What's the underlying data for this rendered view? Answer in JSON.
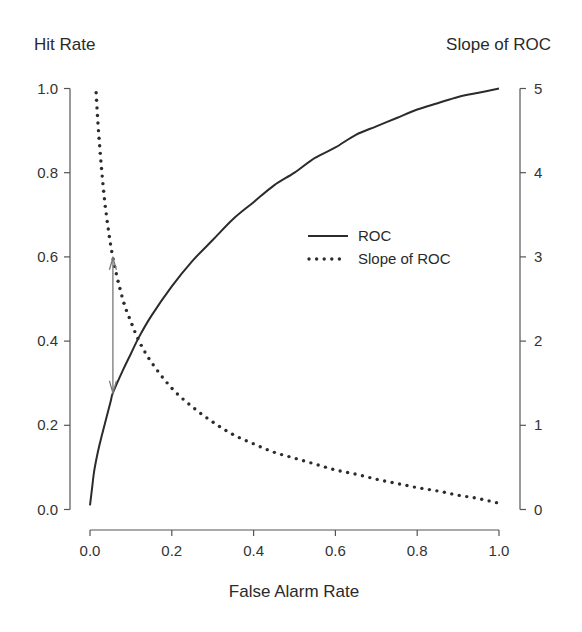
{
  "chart_data": {
    "type": "line",
    "title": "",
    "xlabel": "False Alarm Rate",
    "ylabel_left": "Hit Rate",
    "ylabel_right": "Slope  of ROC",
    "xlim": [
      0,
      1
    ],
    "ylim_left": [
      0,
      1
    ],
    "ylim_right": [
      0,
      5
    ],
    "x_ticks": [
      "0.0",
      "0.2",
      "0.4",
      "0.6",
      "0.8",
      "1.0"
    ],
    "y_left_ticks": [
      "0.0",
      "0.2",
      "0.4",
      "0.6",
      "0.8",
      "1.0"
    ],
    "y_right_ticks": [
      "0",
      "1",
      "2",
      "3",
      "4",
      "5"
    ],
    "grid": false,
    "legend": {
      "position": "center-right",
      "entries": [
        {
          "label": "ROC",
          "style": "solid"
        },
        {
          "label": "Slope of ROC",
          "style": "dotted"
        }
      ]
    },
    "series": [
      {
        "name": "ROC",
        "axis": "left",
        "style": "solid",
        "x": [
          0.0,
          0.005,
          0.01,
          0.02,
          0.03,
          0.05,
          0.056,
          0.08,
          0.1,
          0.12,
          0.15,
          0.2,
          0.25,
          0.3,
          0.35,
          0.4,
          0.45,
          0.5,
          0.55,
          0.6,
          0.65,
          0.7,
          0.75,
          0.8,
          0.85,
          0.9,
          0.95,
          1.0
        ],
        "y": [
          0.01,
          0.05,
          0.09,
          0.14,
          0.18,
          0.255,
          0.277,
          0.33,
          0.37,
          0.41,
          0.46,
          0.53,
          0.59,
          0.64,
          0.69,
          0.73,
          0.77,
          0.8,
          0.835,
          0.86,
          0.89,
          0.91,
          0.93,
          0.95,
          0.965,
          0.98,
          0.99,
          1.0
        ]
      },
      {
        "name": "Slope of ROC",
        "axis": "right",
        "style": "dotted",
        "x": [
          0.015,
          0.02,
          0.03,
          0.04,
          0.056,
          0.08,
          0.1,
          0.12,
          0.15,
          0.2,
          0.25,
          0.3,
          0.35,
          0.4,
          0.45,
          0.5,
          0.55,
          0.6,
          0.65,
          0.7,
          0.75,
          0.8,
          0.85,
          0.9,
          0.95,
          0.995
        ],
        "y": [
          4.95,
          4.55,
          3.95,
          3.5,
          2.99,
          2.5,
          2.23,
          2.0,
          1.75,
          1.44,
          1.22,
          1.04,
          0.89,
          0.78,
          0.68,
          0.61,
          0.54,
          0.47,
          0.42,
          0.36,
          0.31,
          0.26,
          0.22,
          0.17,
          0.13,
          0.08
        ]
      }
    ],
    "annotations": [
      {
        "type": "double-arrow",
        "x": 0.056,
        "from_hit_rate": 0.277,
        "to_slope": 2.99,
        "color": "#777777"
      }
    ]
  }
}
